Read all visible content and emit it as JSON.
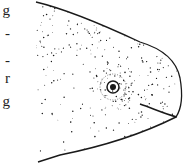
{
  "text_fragments": [
    "g",
    "-",
    "-",
    "r",
    "g"
  ],
  "illustration": {
    "subject": "fish head",
    "style": "stippled ink drawing",
    "facing": "right",
    "ink_color": "#1a1a1a",
    "paper_color": "#ffffff"
  }
}
